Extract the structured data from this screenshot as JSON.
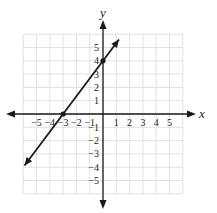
{
  "chart_data": {
    "type": "line",
    "title": "",
    "xlabel": "x",
    "ylabel": "y",
    "xlim": [
      -6,
      6
    ],
    "ylim": [
      -6,
      6
    ],
    "grid": true,
    "x_ticks": [
      -5,
      -4,
      -3,
      -2,
      -1,
      1,
      2,
      3,
      4,
      5
    ],
    "y_ticks": [
      5,
      4,
      3,
      2,
      1,
      -1,
      -2,
      -3,
      -4,
      -5
    ],
    "x_tick_labels": [
      "−5",
      "−4",
      "−3",
      "−2",
      "−1",
      "1",
      "2",
      "3",
      "4",
      "5"
    ],
    "y_tick_labels": [
      "5",
      "4",
      "3",
      "2",
      "1",
      "−1",
      "−2",
      "−3",
      "−4",
      "−5"
    ],
    "series": [
      {
        "name": "line",
        "equation": "y = (4/3)x + 4",
        "x": [
          -5.9,
          1.2
        ],
        "y": [
          -3.87,
          5.6
        ],
        "arrows": "both"
      }
    ],
    "points": [
      {
        "x": -3,
        "y": 0,
        "label": "x-intercept"
      },
      {
        "x": 0,
        "y": 4,
        "label": "y-intercept"
      }
    ]
  },
  "labels": {
    "x_axis": "x",
    "y_axis": "y"
  },
  "colors": {
    "grid": "#d9d9d9",
    "axis": "#1a1a1a",
    "line": "#1a1a1a"
  }
}
